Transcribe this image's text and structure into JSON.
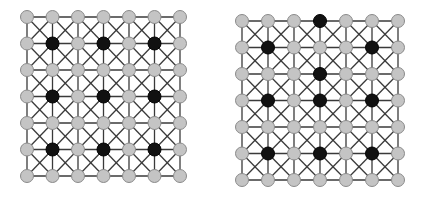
{
  "colors": {
    "background": "#ffffff",
    "edge": "#3a3a3a",
    "node_fill": "#c4c4c4",
    "node_stroke": "#8a8a8a",
    "highlight_fill": "#111111",
    "highlight_stroke": "#000000"
  },
  "grids": [
    {
      "id": "left-grid",
      "rows": 7,
      "cols": 7,
      "x0": 27,
      "y0": 17,
      "x1": 180,
      "y1": 176,
      "node_radius": 6.5,
      "edges": "orthogonal-plus-both-diagonals-per-cell",
      "highlighted": [
        [
          1,
          1
        ],
        [
          1,
          3
        ],
        [
          1,
          5
        ],
        [
          3,
          1
        ],
        [
          3,
          3
        ],
        [
          3,
          5
        ],
        [
          5,
          1
        ],
        [
          5,
          3
        ],
        [
          5,
          5
        ]
      ]
    },
    {
      "id": "right-grid",
      "rows": 7,
      "cols": 7,
      "x0": 242,
      "y0": 21,
      "x1": 398,
      "y1": 180,
      "node_radius": 6.5,
      "edges": "orthogonal-plus-both-diagonals-per-cell",
      "highlighted": [
        [
          0,
          3
        ],
        [
          1,
          1
        ],
        [
          1,
          5
        ],
        [
          2,
          3
        ],
        [
          3,
          1
        ],
        [
          3,
          3
        ],
        [
          3,
          5
        ],
        [
          5,
          1
        ],
        [
          5,
          3
        ],
        [
          5,
          5
        ]
      ]
    }
  ]
}
